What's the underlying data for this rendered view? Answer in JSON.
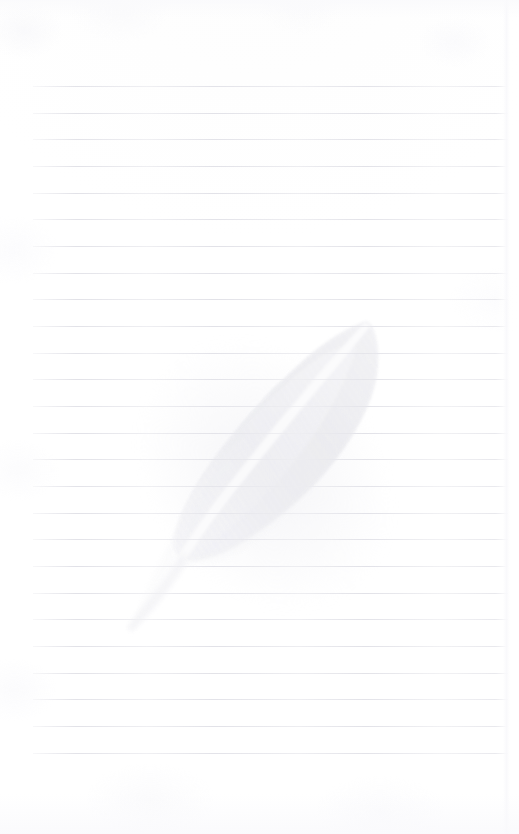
{
  "page": {
    "title": "Ruled notebook page",
    "kind": "lined-paper-scan",
    "width": 519,
    "height": 834,
    "background_color": "#ffffff",
    "text_content": "",
    "has_handwriting": false
  },
  "ruling": {
    "name": "horizontal-ruled-lines",
    "line_color": "#dcdce3",
    "line_count": 26,
    "line_thickness_px": 1,
    "line_spacing_px": 26.7,
    "first_line_y": 86,
    "last_line_y": 753,
    "left_margin_x": 33,
    "right_margin_x": 508,
    "line_length_px": 475,
    "y_positions": [
      86,
      113,
      139,
      166,
      193,
      219,
      246,
      273,
      299,
      326,
      353,
      379,
      406,
      433,
      459,
      486,
      513,
      539,
      566,
      593,
      619,
      646,
      673,
      699,
      726,
      753
    ]
  },
  "watermark": {
    "name": "feather-watermark",
    "description": "Pale grey quill feather printed as a faint watermark",
    "color": "#eeeef1",
    "shaft_color": "#f7f7f9",
    "opacity": 0.85,
    "rotation_deg": -38,
    "tip_point": {
      "x": 372,
      "y": 326
    },
    "quill_end_point": {
      "x": 128,
      "y": 628
    },
    "widest_left": {
      "x": 193,
      "y": 487
    },
    "widest_right": {
      "x": 379,
      "y": 394
    }
  },
  "margins": {
    "top_blank_px": 86,
    "bottom_blank_px": 81,
    "left_blank_px": 33,
    "right_blank_px": 11
  }
}
